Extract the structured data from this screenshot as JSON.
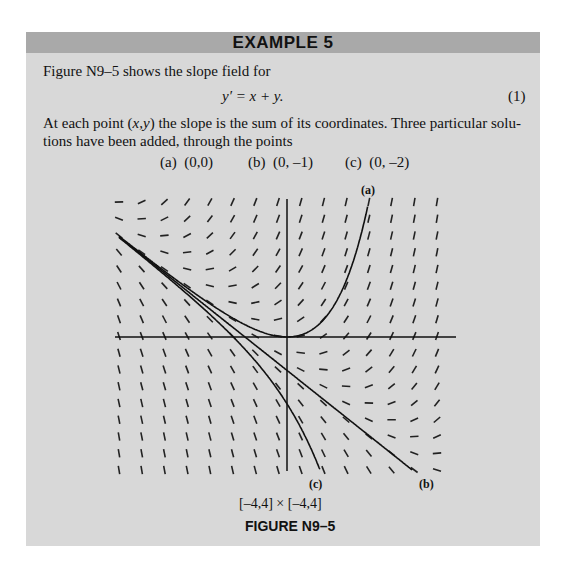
{
  "header": {
    "title": "EXAMPLE 5"
  },
  "body": {
    "intro": "Figure N9–5 shows the slope field for",
    "equation": "y′ = x + y.",
    "equation_number": "(1)",
    "para_line1": "At each point (x,y) the slope is the sum of its coordinates. Three particular solu-",
    "para_line2": "tions have been added, through the points",
    "points": [
      {
        "label": "(a)",
        "value": "(0,0)"
      },
      {
        "label": "(b)",
        "value": "(0, –1)"
      },
      {
        "label": "(c)",
        "value": "(0, –2)"
      }
    ]
  },
  "figure": {
    "window": "[–4,4] × [–4,4]",
    "title": "FIGURE N9–5",
    "curve_labels": {
      "a": "(a)",
      "b": "(b)",
      "c": "(c)"
    }
  },
  "chart_data": {
    "type": "slope_field",
    "title": "FIGURE N9–5",
    "equation": "y' = x + y",
    "xlim": [
      -4,
      4
    ],
    "ylim": [
      -4,
      4
    ],
    "grid": {
      "columns": 15,
      "rows": 17
    },
    "solutions": [
      {
        "name": "(a)",
        "through": [
          0,
          0
        ],
        "formula": "y = -x - 1 + e^x"
      },
      {
        "name": "(b)",
        "through": [
          0,
          -1
        ],
        "formula": "y = -x - 1"
      },
      {
        "name": "(c)",
        "through": [
          0,
          -2
        ],
        "formula": "y = -x - 1 - e^x"
      }
    ],
    "axes": {
      "x_axis": true,
      "y_axis": true,
      "tick_labels": false
    }
  }
}
